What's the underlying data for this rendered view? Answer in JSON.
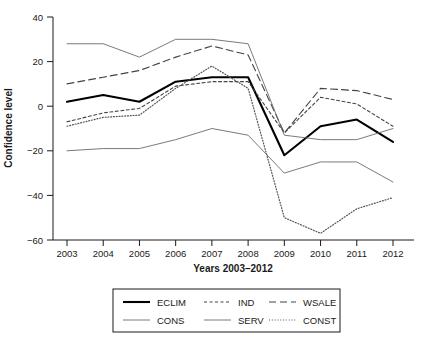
{
  "chart_data": {
    "type": "line",
    "title": "",
    "xlabel": "Years 2003–2012",
    "ylabel": "Confidence level",
    "categories": [
      "2003",
      "2004",
      "2005",
      "2006",
      "2007",
      "2008",
      "2009",
      "2010",
      "2011",
      "2012"
    ],
    "x": [
      2003,
      2004,
      2005,
      2006,
      2007,
      2008,
      2009,
      2010,
      2011,
      2012
    ],
    "ylim": [
      -60,
      40
    ],
    "xlim": [
      2003,
      2012
    ],
    "yticks": [
      40,
      20,
      0,
      -20,
      -40,
      -60
    ],
    "ytick_labels": [
      "40",
      "20",
      "0",
      "−20",
      "−40",
      "−60"
    ],
    "grid": false,
    "legend_position": "below-axes",
    "legend_columns": 3,
    "series": [
      {
        "name": "ECLIM",
        "style": "solid-thick",
        "color": "#000000",
        "values": [
          2,
          5,
          2,
          11,
          13,
          13,
          -22,
          -9,
          -6,
          -16
        ]
      },
      {
        "name": "IND",
        "style": "dashed-fine",
        "color": "#444444",
        "values": [
          -7,
          -3,
          -1,
          9,
          11,
          11,
          -12,
          4,
          1,
          -9
        ]
      },
      {
        "name": "WSALE",
        "style": "dashed-long",
        "color": "#444444",
        "values": [
          10,
          13,
          16,
          22,
          27,
          23,
          -12,
          8,
          7,
          3
        ]
      },
      {
        "name": "CONS",
        "style": "solid-thin",
        "color": "#6b6b6b",
        "values": [
          -20,
          -19,
          -19,
          -15,
          -10,
          -13,
          -30,
          -25,
          -25,
          -34
        ]
      },
      {
        "name": "SERV",
        "style": "solid-thin",
        "color": "#6b6b6b",
        "values": [
          28,
          28,
          22,
          30,
          30,
          28,
          -13,
          -15,
          -15,
          -10
        ]
      },
      {
        "name": "CONST",
        "style": "dotted",
        "color": "#555555",
        "values": [
          -9,
          -5,
          -4,
          8,
          18,
          8,
          -50,
          -57,
          -46,
          -41
        ]
      }
    ]
  },
  "legend": {
    "items": [
      {
        "label": "ECLIM",
        "style": "solid-thick"
      },
      {
        "label": "IND",
        "style": "dashed-fine"
      },
      {
        "label": "WSALE",
        "style": "dashed-long"
      },
      {
        "label": "CONS",
        "style": "solid-thin"
      },
      {
        "label": "SERV",
        "style": "solid-thin"
      },
      {
        "label": "CONST",
        "style": "dotted"
      }
    ]
  }
}
